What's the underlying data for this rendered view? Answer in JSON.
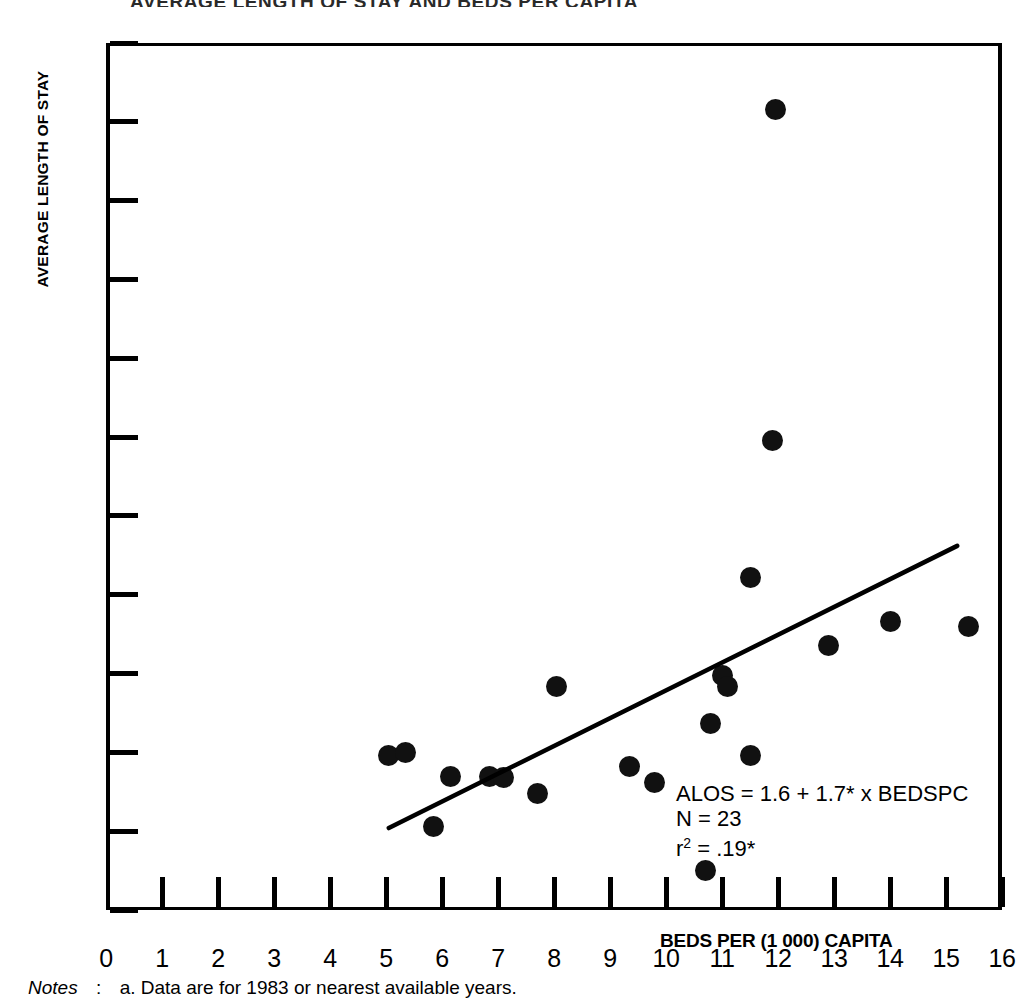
{
  "chart_title": "AVERAGE LENGTH OF STAY AND BEDS PER CAPITA",
  "y_axis_title": "AVERAGE LENGTH OF STAY",
  "x_axis_title": "BEDS PER (1 000) CAPITA",
  "annotation": {
    "equation": "ALOS  = 1.6 + 1.7* x BEDSPC",
    "n": "N = 23",
    "r2_prefix": "r",
    "r2_sup": "2",
    "r2_value": " = .19*"
  },
  "notes": {
    "label": "Notes",
    "colon": ":",
    "text": "a. Data are for 1983 or nearest available years."
  },
  "colors": {
    "point": "#111111",
    "axis": "#000000",
    "line": "#000000",
    "background": "#ffffff"
  },
  "chart_data": {
    "type": "scatter",
    "title": "AVERAGE LENGTH OF STAY AND BEDS PER CAPITA",
    "xlabel": "BEDS PER (1 000) CAPITA",
    "ylabel": "AVERAGE LENGTH OF STAY",
    "xlim": [
      0,
      16
    ],
    "ylim": [
      5,
      60
    ],
    "xticks": [
      0,
      1,
      2,
      3,
      4,
      5,
      6,
      7,
      8,
      9,
      10,
      11,
      12,
      13,
      14,
      15,
      16
    ],
    "yticks": [
      5,
      10,
      15,
      20,
      25,
      30,
      35,
      40,
      45,
      50,
      55,
      60
    ],
    "grid": false,
    "legend": false,
    "n_points": 23,
    "points": [
      {
        "x": 5.05,
        "y": 14.8
      },
      {
        "x": 5.35,
        "y": 15.0
      },
      {
        "x": 5.85,
        "y": 10.3
      },
      {
        "x": 6.15,
        "y": 13.5
      },
      {
        "x": 6.85,
        "y": 13.5
      },
      {
        "x": 7.1,
        "y": 13.4
      },
      {
        "x": 7.7,
        "y": 12.4
      },
      {
        "x": 8.05,
        "y": 19.2
      },
      {
        "x": 9.35,
        "y": 14.1
      },
      {
        "x": 9.8,
        "y": 13.1
      },
      {
        "x": 10.7,
        "y": 7.5
      },
      {
        "x": 10.8,
        "y": 16.8
      },
      {
        "x": 11.0,
        "y": 19.9
      },
      {
        "x": 11.1,
        "y": 19.2
      },
      {
        "x": 11.5,
        "y": 14.8
      },
      {
        "x": 11.5,
        "y": 26.1
      },
      {
        "x": 11.9,
        "y": 34.8
      },
      {
        "x": 11.95,
        "y": 55.8
      },
      {
        "x": 12.9,
        "y": 21.8
      },
      {
        "x": 14.0,
        "y": 23.3
      },
      {
        "x": 15.4,
        "y": 23.0
      }
    ],
    "regression_line": {
      "equation": "ALOS = 1.6 + 1.7* x BEDSPC",
      "intercept": 1.6,
      "slope": 1.7,
      "r_squared": 0.19,
      "n": 23,
      "x_start": 5.05,
      "y_start": 10.2,
      "x_end": 15.2,
      "y_end": 28.1
    }
  }
}
